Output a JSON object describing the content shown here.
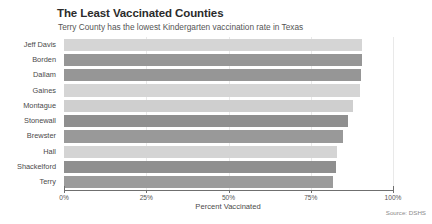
{
  "chart_data": {
    "type": "bar",
    "orientation": "horizontal",
    "title": "The Least Vaccinated Counties",
    "subtitle": "Terry County has the lowest Kindergarten vaccination rate in Texas",
    "xlabel": "Percent Vaccinated",
    "ylabel": "",
    "source": "Source: DSHS",
    "xlim": [
      0,
      100
    ],
    "xticks": [
      0,
      25,
      50,
      75,
      100
    ],
    "xtick_labels": [
      "0%",
      "25%",
      "50%",
      "75%",
      "100%"
    ],
    "grid": true,
    "legend": "none",
    "categories": [
      "Jeff Davis",
      "Borden",
      "Dallam",
      "Gaines",
      "Montague",
      "Stonewall",
      "Brewster",
      "Hall",
      "Shackelford",
      "Terry"
    ],
    "values": [
      90.5,
      90.5,
      90.3,
      90.0,
      87.8,
      86.2,
      84.9,
      83.1,
      82.6,
      81.9
    ],
    "bar_colors": [
      "#d5d5d5",
      "#969696",
      "#969696",
      "#d5d5d5",
      "#cfcfcf",
      "#8f8f8f",
      "#999999",
      "#d4d4d4",
      "#8f8f8f",
      "#9b9b9b"
    ]
  },
  "colors": {
    "axis": "#6f6f6f",
    "grid": "#e9e9e9",
    "title": "#2b2b2b",
    "text": "#4a4a4a",
    "source": "#8a8a8a"
  }
}
